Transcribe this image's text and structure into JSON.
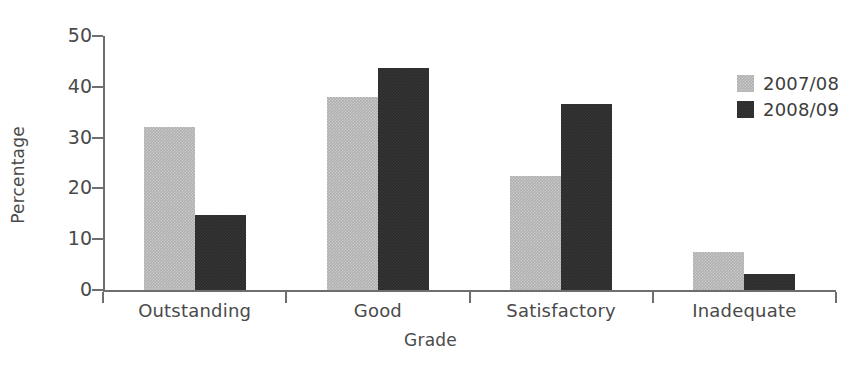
{
  "chart_data": {
    "type": "bar",
    "title": "",
    "subtitle": "",
    "xlabel": "Grade",
    "ylabel": "Percentage",
    "categories": [
      "Outstanding",
      "Good",
      "Satisfactory",
      "Inadequate"
    ],
    "series": [
      {
        "name": "2007/08",
        "color": "#b0b0b0",
        "values": [
          32.0,
          38.0,
          22.5,
          7.5
        ]
      },
      {
        "name": "2008/09",
        "color": "#2b2b2b",
        "values": [
          14.7,
          43.7,
          36.7,
          3.2
        ]
      }
    ],
    "ylim": [
      0,
      50
    ],
    "ytick_labels": [
      "0",
      "10",
      "20",
      "30",
      "40",
      "50"
    ],
    "ytick_values": [
      0,
      10,
      20,
      30,
      40,
      50
    ],
    "grid": false,
    "legend_position": "top-right",
    "legend_entries": [
      "2007/08",
      "2008/09"
    ],
    "axis_color": "#6e6e6e",
    "text_color": "#4a4a4a",
    "background_color": "#ffffff"
  }
}
